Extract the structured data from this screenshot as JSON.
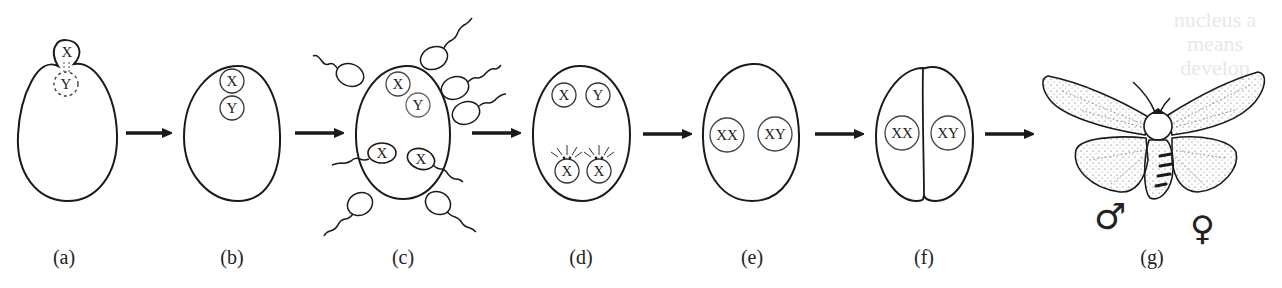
{
  "figure": {
    "panels": [
      {
        "id": "a",
        "label": "(a)",
        "nuclei": [
          "X",
          "Y"
        ]
      },
      {
        "id": "b",
        "label": "(b)",
        "nuclei": [
          "X",
          "Y"
        ]
      },
      {
        "id": "c",
        "label": "(c)",
        "nuclei": [
          "X",
          "Y",
          "X",
          "X"
        ],
        "sperm_count": 8
      },
      {
        "id": "d",
        "label": "(d)",
        "nuclei": [
          "X",
          "Y",
          "X",
          "X"
        ]
      },
      {
        "id": "e",
        "label": "(e)",
        "nuclei": [
          "XX",
          "XY"
        ]
      },
      {
        "id": "f",
        "label": "(f)",
        "nuclei": [
          "XX",
          "XY"
        ]
      },
      {
        "id": "g",
        "label": "(g)",
        "symbols": {
          "male": "♂",
          "female": "♀"
        }
      }
    ],
    "arrow_count": 6,
    "background_bleed_text": [
      "nucleus a",
      "means",
      "develop"
    ]
  },
  "colors": {
    "stroke": "#1a1a1a",
    "background": "#ffffff",
    "ghost_text": "#e8e8e8"
  }
}
